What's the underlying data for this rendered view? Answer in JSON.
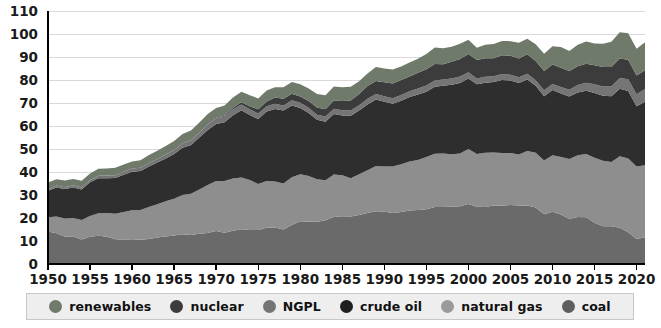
{
  "chart_data": {
    "type": "area",
    "stacked": true,
    "title": "",
    "subtitle": "",
    "xlabel": "",
    "ylabel": "",
    "xlim": [
      1950,
      2021
    ],
    "ylim": [
      0,
      110
    ],
    "grid": true,
    "legend_position": "bottom",
    "x_tick_labels": [
      "1950",
      "1955",
      "1960",
      "1965",
      "1970",
      "1975",
      "1980",
      "1985",
      "1990",
      "1995",
      "2000",
      "2005",
      "2010",
      "2015",
      "2020"
    ],
    "x_ticks": [
      1950,
      1955,
      1960,
      1965,
      1970,
      1975,
      1980,
      1985,
      1990,
      1995,
      2000,
      2005,
      2010,
      2015,
      2020
    ],
    "y_tick_labels": [
      "0",
      "10",
      "20",
      "30",
      "40",
      "50",
      "60",
      "70",
      "80",
      "90",
      "100",
      "110"
    ],
    "y_ticks": [
      0,
      10,
      20,
      30,
      40,
      50,
      60,
      70,
      80,
      90,
      100,
      110
    ],
    "x": [
      1950,
      1951,
      1952,
      1953,
      1954,
      1955,
      1956,
      1957,
      1958,
      1959,
      1960,
      1961,
      1962,
      1963,
      1964,
      1965,
      1966,
      1967,
      1968,
      1969,
      1970,
      1971,
      1972,
      1973,
      1974,
      1975,
      1976,
      1977,
      1978,
      1979,
      1980,
      1981,
      1982,
      1983,
      1984,
      1985,
      1986,
      1987,
      1988,
      1989,
      1990,
      1991,
      1992,
      1993,
      1994,
      1995,
      1996,
      1997,
      1998,
      1999,
      2000,
      2001,
      2002,
      2003,
      2004,
      2005,
      2006,
      2007,
      2008,
      2009,
      2010,
      2011,
      2012,
      2013,
      2014,
      2015,
      2016,
      2017,
      2018,
      2019,
      2020,
      2021
    ],
    "stack_order_bottom_to_top": [
      "coal",
      "natural gas",
      "crude oil",
      "NGPL",
      "nuclear",
      "renewables"
    ],
    "series": [
      {
        "name": "coal",
        "color": "#6a6a6a",
        "values": [
          14.1,
          13.4,
          12.0,
          12.0,
          10.6,
          11.9,
          12.3,
          11.8,
          10.8,
          10.6,
          10.8,
          10.5,
          10.9,
          11.5,
          12.0,
          12.4,
          12.9,
          12.6,
          13.1,
          13.5,
          14.3,
          13.6,
          14.5,
          15.1,
          14.8,
          14.8,
          15.8,
          15.9,
          15.0,
          17.0,
          18.6,
          18.4,
          18.4,
          19.0,
          20.4,
          20.8,
          20.6,
          21.3,
          22.2,
          22.9,
          22.7,
          22.2,
          22.6,
          23.3,
          23.5,
          23.8,
          24.8,
          24.8,
          24.9,
          25.1,
          26.1,
          24.9,
          24.8,
          25.4,
          25.3,
          25.7,
          25.4,
          25.4,
          24.6,
          21.6,
          22.7,
          21.5,
          19.6,
          20.4,
          20.3,
          17.9,
          16.4,
          16.4,
          15.8,
          13.8,
          10.9,
          11.6
        ]
      },
      {
        "name": "natural gas",
        "color": "#8e8e8e",
        "values": [
          6.2,
          7.3,
          7.8,
          8.0,
          8.5,
          9.0,
          9.8,
          10.4,
          11.0,
          12.0,
          12.6,
          13.0,
          13.9,
          14.5,
          15.3,
          16.0,
          17.1,
          17.9,
          19.3,
          20.9,
          21.8,
          22.5,
          22.7,
          22.5,
          21.7,
          20.0,
          20.3,
          20.0,
          20.0,
          20.7,
          20.4,
          19.9,
          18.5,
          17.4,
          18.5,
          17.8,
          16.7,
          17.7,
          18.6,
          19.7,
          19.7,
          20.2,
          20.8,
          21.3,
          21.7,
          22.7,
          23.1,
          23.2,
          22.8,
          22.9,
          23.9,
          22.9,
          23.6,
          23.1,
          23.0,
          22.6,
          22.2,
          23.7,
          23.8,
          23.4,
          24.6,
          25.0,
          26.1,
          26.9,
          27.5,
          28.3,
          28.5,
          28.0,
          31.0,
          32.1,
          31.5,
          31.3
        ]
      },
      {
        "name": "crude oil",
        "color": "#2e2e2e",
        "values": [
          11.5,
          12.6,
          12.8,
          13.3,
          13.3,
          14.6,
          15.2,
          15.1,
          15.6,
          16.2,
          16.7,
          16.9,
          17.6,
          18.1,
          18.6,
          19.4,
          20.5,
          21.2,
          22.6,
          23.9,
          24.8,
          25.5,
          27.5,
          29.2,
          28.3,
          28.2,
          30.2,
          31.5,
          31.7,
          31.2,
          28.8,
          27.3,
          25.8,
          25.5,
          26.3,
          26.0,
          27.2,
          27.7,
          28.6,
          28.9,
          28.1,
          27.3,
          27.6,
          28.0,
          28.5,
          28.4,
          29.2,
          29.5,
          30.2,
          30.7,
          30.7,
          30.3,
          30.4,
          30.6,
          31.7,
          31.5,
          31.1,
          31.1,
          29.1,
          27.9,
          28.3,
          27.6,
          27.1,
          27.3,
          27.5,
          28.1,
          28.3,
          28.5,
          29.4,
          29.3,
          26.2,
          27.6
        ]
      },
      {
        "name": "NGPL",
        "color": "#757575",
        "values": [
          0.7,
          0.8,
          0.8,
          0.9,
          0.9,
          1.0,
          1.1,
          1.2,
          1.2,
          1.3,
          1.4,
          1.4,
          1.5,
          1.6,
          1.7,
          1.8,
          1.9,
          2.0,
          2.1,
          2.3,
          2.5,
          2.5,
          2.6,
          2.6,
          2.5,
          2.4,
          2.3,
          2.3,
          2.2,
          2.3,
          2.3,
          2.3,
          2.2,
          2.2,
          2.3,
          2.2,
          2.2,
          2.3,
          2.4,
          2.4,
          2.4,
          2.4,
          2.5,
          2.5,
          2.6,
          2.7,
          2.7,
          2.7,
          2.8,
          2.8,
          2.7,
          2.6,
          2.6,
          2.5,
          2.6,
          2.5,
          2.5,
          2.5,
          2.4,
          2.6,
          2.7,
          2.9,
          3.0,
          3.2,
          3.5,
          3.8,
          4.0,
          4.3,
          4.7,
          5.1,
          5.2,
          5.6
        ]
      },
      {
        "name": "nuclear",
        "color": "#3c3c3c",
        "values": [
          0.0,
          0.0,
          0.0,
          0.0,
          0.0,
          0.0,
          0.0,
          0.0,
          0.0,
          0.0,
          0.0,
          0.0,
          0.0,
          0.0,
          0.0,
          0.0,
          0.1,
          0.1,
          0.1,
          0.2,
          0.2,
          0.4,
          0.6,
          0.9,
          1.3,
          1.9,
          2.1,
          2.7,
          3.0,
          2.8,
          2.7,
          3.0,
          3.1,
          3.2,
          3.6,
          4.1,
          4.4,
          4.9,
          5.6,
          5.7,
          6.1,
          6.4,
          6.5,
          6.4,
          6.8,
          7.1,
          7.2,
          6.7,
          7.2,
          7.6,
          7.9,
          8.0,
          8.1,
          7.9,
          8.2,
          8.2,
          8.2,
          8.5,
          8.4,
          8.4,
          8.4,
          8.3,
          8.1,
          8.2,
          8.3,
          8.3,
          8.4,
          8.4,
          8.4,
          8.5,
          8.2,
          8.1
        ]
      },
      {
        "name": "renewables",
        "color": "#6f7a6b",
        "values": [
          2.9,
          2.8,
          2.9,
          2.8,
          2.9,
          2.8,
          3.0,
          3.0,
          3.2,
          3.2,
          3.1,
          3.3,
          3.5,
          3.5,
          3.7,
          3.9,
          4.0,
          4.2,
          4.3,
          4.4,
          4.2,
          4.4,
          4.5,
          4.6,
          4.8,
          4.7,
          4.7,
          4.4,
          5.0,
          5.1,
          5.4,
          5.4,
          5.9,
          6.1,
          6.1,
          6.0,
          6.0,
          5.6,
          5.4,
          6.1,
          6.0,
          6.1,
          5.9,
          6.1,
          6.1,
          6.6,
          7.1,
          6.9,
          6.6,
          6.7,
          6.2,
          5.3,
          5.8,
          6.1,
          6.2,
          6.4,
          6.8,
          6.7,
          7.2,
          7.5,
          8.0,
          9.1,
          8.7,
          9.3,
          9.6,
          9.5,
          10.2,
          11.0,
          11.5,
          11.5,
          11.6,
          12.2
        ]
      }
    ],
    "legend": [
      {
        "label": "renewables",
        "color": "#6f7a6b"
      },
      {
        "label": "nuclear",
        "color": "#3c3c3c"
      },
      {
        "label": "NGPL",
        "color": "#757575"
      },
      {
        "label": "crude oil",
        "color": "#1f1f1f"
      },
      {
        "label": "natural gas",
        "color": "#9a9a9a"
      },
      {
        "label": "coal",
        "color": "#5e5e5e"
      }
    ]
  }
}
